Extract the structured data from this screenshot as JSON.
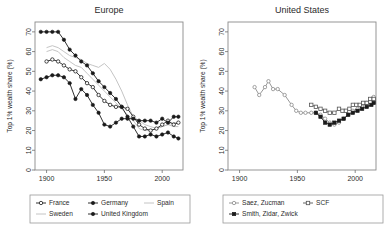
{
  "figure": {
    "ylabel": "Top 1% wealth share (%)",
    "yticks": [
      0,
      10,
      20,
      30,
      40,
      50,
      60,
      70
    ],
    "xticks": [
      1900,
      1950,
      2000
    ],
    "xlim": [
      1890,
      2018
    ],
    "ylim": [
      0,
      75
    ],
    "colors": {
      "dark": "#1a1a1a",
      "light": "#bdbdbd",
      "mid": "#6d6d6d",
      "frame": "#8a8a8a"
    }
  },
  "chart_data": [
    {
      "type": "line",
      "title": "Europe",
      "xlabel": "",
      "ylabel": "Top 1% wealth share (%)",
      "xlim": [
        1890,
        2018
      ],
      "ylim": [
        0,
        75
      ],
      "xticks": [
        1900,
        1950,
        2000
      ],
      "yticks": [
        0,
        10,
        20,
        30,
        40,
        50,
        60,
        70
      ],
      "grid": false,
      "legend_position": "below",
      "series": [
        {
          "name": "France",
          "marker": "open-circle",
          "color": "#1a1a1a",
          "x": [
            1900,
            1905,
            1910,
            1915,
            1920,
            1925,
            1930,
            1935,
            1940,
            1945,
            1950,
            1955,
            1960,
            1965,
            1970,
            1975,
            1980,
            1985,
            1990,
            1995,
            2000,
            2005,
            2010,
            2014
          ],
          "values": [
            55,
            56,
            55,
            53,
            51,
            50,
            47,
            44,
            42,
            38,
            35,
            33,
            32,
            32,
            31,
            27,
            23,
            21,
            20,
            21,
            23,
            25,
            23,
            24
          ]
        },
        {
          "name": "Germany",
          "marker": "filled-circle",
          "color": "#1a1a1a",
          "x": [
            1895,
            1900,
            1905,
            1910,
            1915,
            1920,
            1925,
            1930,
            1935,
            1940,
            1945,
            1950,
            1955,
            1960,
            1965,
            1970,
            1975,
            1980,
            1985,
            1990,
            1995,
            2000,
            2005,
            2010,
            2014
          ],
          "values": [
            46,
            47,
            48,
            48,
            47,
            44,
            36,
            41,
            38,
            33,
            29,
            23,
            22,
            24,
            26,
            26,
            26,
            25,
            25,
            25,
            24,
            26,
            24,
            27,
            27
          ]
        },
        {
          "name": "Spain",
          "marker": "none",
          "color": "#bdbdbd",
          "x": [
            1900,
            1905,
            1910,
            1915,
            1920,
            1925,
            1930,
            1935,
            1940,
            1945,
            1950,
            1955,
            1960,
            1965,
            1970,
            1975,
            1980,
            1985,
            1990,
            1995,
            2000,
            2005,
            2010,
            2014
          ],
          "values": [
            62,
            63,
            62,
            60,
            58,
            57,
            56,
            54,
            53,
            52,
            54,
            51,
            46,
            40,
            33,
            27,
            25,
            23,
            22,
            21,
            22,
            23,
            24,
            24
          ]
        },
        {
          "name": "Sweden",
          "marker": "none",
          "color": "#bdbdbd",
          "x": [
            1900,
            1905,
            1910,
            1915,
            1920,
            1925,
            1930,
            1935,
            1940,
            1945,
            1950,
            1955,
            1960,
            1965,
            1970,
            1975,
            1980,
            1985,
            1990,
            1995,
            2000,
            2005,
            2010,
            2014
          ],
          "values": [
            60,
            61,
            60,
            57,
            55,
            53,
            52,
            49,
            46,
            43,
            40,
            37,
            34,
            31,
            28,
            25,
            21,
            20,
            20,
            21,
            22,
            23,
            22,
            22
          ]
        },
        {
          "name": "United Kingdom",
          "marker": "filled-circle",
          "color": "#1a1a1a",
          "x": [
            1895,
            1900,
            1905,
            1910,
            1915,
            1920,
            1925,
            1930,
            1935,
            1940,
            1945,
            1950,
            1955,
            1960,
            1965,
            1970,
            1975,
            1980,
            1985,
            1990,
            1995,
            2000,
            2005,
            2010,
            2014
          ],
          "values": [
            70,
            70,
            70,
            70,
            66,
            61,
            58,
            55,
            53,
            49,
            45,
            42,
            39,
            36,
            32,
            27,
            22,
            17,
            17,
            18,
            17,
            18,
            19,
            17,
            16
          ]
        }
      ]
    },
    {
      "type": "line",
      "title": "United States",
      "xlabel": "",
      "ylabel": "Top 1% wealth share (%)",
      "xlim": [
        1890,
        2018
      ],
      "ylim": [
        0,
        75
      ],
      "xticks": [
        1900,
        1950,
        2000
      ],
      "yticks": [
        0,
        10,
        20,
        30,
        40,
        50,
        60,
        70
      ],
      "grid": false,
      "legend_position": "below",
      "series": [
        {
          "name": "Saez, Zucman",
          "marker": "open-circle",
          "color": "#8c8c8c",
          "x": [
            1913,
            1917,
            1922,
            1925,
            1929,
            1933,
            1939,
            1945,
            1949,
            1953,
            1957,
            1962,
            1966,
            1970,
            1974,
            1978,
            1982,
            1986,
            1990,
            1994,
            1998,
            2002,
            2006,
            2010,
            2014,
            2016
          ],
          "values": [
            42,
            38,
            42,
            45,
            41,
            41,
            38,
            33,
            30,
            29,
            29,
            29,
            29,
            28,
            26,
            24,
            23,
            24,
            26,
            28,
            30,
            31,
            32,
            34,
            36,
            37
          ]
        },
        {
          "name": "SCF",
          "marker": "open-square",
          "color": "#555555",
          "x": [
            1962,
            1966,
            1970,
            1974,
            1978,
            1982,
            1986,
            1989,
            1992,
            1995,
            1998,
            2001,
            2004,
            2007,
            2010,
            2013,
            2016
          ],
          "values": [
            33,
            32,
            31,
            30,
            29,
            29,
            31,
            30,
            30,
            31,
            33,
            33,
            33,
            34,
            34,
            36,
            36
          ]
        },
        {
          "name": "Smith, Zidar, Zwick",
          "marker": "filled-square",
          "color": "#1a1a1a",
          "x": [
            1966,
            1970,
            1974,
            1978,
            1982,
            1986,
            1990,
            1994,
            1998,
            2002,
            2006,
            2010,
            2014,
            2016
          ],
          "values": [
            29,
            27,
            24,
            23,
            24,
            25,
            26,
            28,
            29,
            30,
            31,
            32,
            33,
            34
          ]
        }
      ]
    }
  ],
  "legends": [
    {
      "panel": "Europe",
      "rows": [
        [
          {
            "label": "France",
            "marker": "open-circle",
            "color": "#1a1a1a"
          },
          {
            "label": "Germany",
            "marker": "filled-circle",
            "color": "#1a1a1a"
          },
          {
            "label": "Spain",
            "marker": "none",
            "color": "#bdbdbd"
          }
        ],
        [
          {
            "label": "Sweden",
            "marker": "none",
            "color": "#bdbdbd"
          },
          {
            "label": "United Kingdom",
            "marker": "filled-circle",
            "color": "#1a1a1a"
          }
        ]
      ]
    },
    {
      "panel": "United States",
      "rows": [
        [
          {
            "label": "Saez, Zucman",
            "marker": "open-circle",
            "color": "#8c8c8c"
          },
          {
            "label": "SCF",
            "marker": "open-square",
            "color": "#555555"
          }
        ],
        [
          {
            "label": "Smith, Zidar, Zwick",
            "marker": "filled-square",
            "color": "#1a1a1a"
          }
        ]
      ]
    }
  ]
}
